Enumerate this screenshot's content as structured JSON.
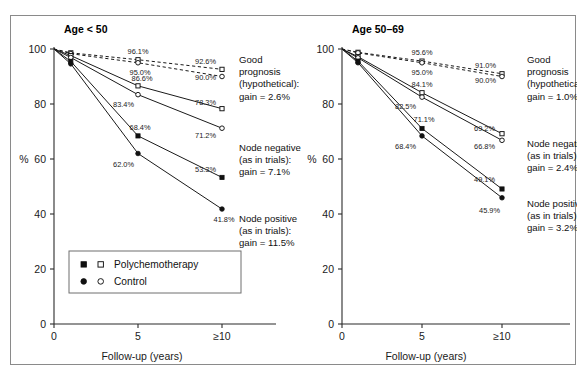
{
  "figure": {
    "y_axis_label": "%",
    "x_axis_label": "Follow-up (years)",
    "y_ticks": [
      "0",
      "20",
      "40",
      "60",
      "80",
      "100"
    ],
    "x_ticks": [
      "0",
      "5",
      "≥10"
    ]
  },
  "legend": {
    "rows": [
      {
        "label": "Polychemotherapy",
        "filled_marker": "square",
        "open_marker": "square"
      },
      {
        "label": "Control",
        "filled_marker": "circle",
        "open_marker": "circle"
      }
    ]
  },
  "chart_data": [
    {
      "type": "line",
      "title": "Age < 50",
      "xlabel": "Follow-up (years)",
      "ylabel": "%",
      "xlim": [
        0,
        11.5
      ],
      "ylim": [
        0,
        100
      ],
      "x": [
        0,
        1,
        5,
        10
      ],
      "x_tick_values": [
        0,
        5,
        10
      ],
      "x_tick_labels": [
        "0",
        "5",
        "≥10"
      ],
      "y_tick_values": [
        0,
        20,
        40,
        60,
        80,
        100
      ],
      "grid": false,
      "legend_position": "lower-left",
      "series": [
        {
          "name": "Good prognosis (hypothetical): Polychemotherapy",
          "group": "Good prognosis (hypothetical)",
          "arm": "Polychemotherapy",
          "marker": "square-open",
          "style": "dashed",
          "values": [
            100.0,
            98.6,
            96.1,
            92.6
          ],
          "point_labels": [
            "",
            "",
            "96.1%",
            "92.6%"
          ]
        },
        {
          "name": "Good prognosis (hypothetical): Control",
          "group": "Good prognosis (hypothetical)",
          "arm": "Control",
          "marker": "circle-open",
          "style": "dashed",
          "values": [
            100.0,
            98.3,
            95.0,
            90.0
          ],
          "point_labels": [
            "",
            "",
            "95.0%",
            "90.0%"
          ]
        },
        {
          "name": "Node negative (as in trials): Polychemotherapy",
          "group": "Node negative (as in trials)",
          "arm": "Polychemotherapy",
          "marker": "square-open",
          "style": "solid",
          "values": [
            100.0,
            97.6,
            86.6,
            78.3
          ],
          "point_labels": [
            "",
            "",
            "86.6%",
            "78.3%"
          ]
        },
        {
          "name": "Node negative (as in trials): Control",
          "group": "Node negative (as in trials)",
          "arm": "Control",
          "marker": "circle-open",
          "style": "solid",
          "values": [
            100.0,
            96.9,
            83.4,
            71.2
          ],
          "point_labels": [
            "",
            "",
            "83.4%",
            "71.2%"
          ]
        },
        {
          "name": "Node positive (as in trials): Polychemotherapy",
          "group": "Node positive (as in trials)",
          "arm": "Polychemotherapy",
          "marker": "square-filled",
          "style": "solid",
          "values": [
            100.0,
            95.5,
            68.4,
            53.3
          ],
          "point_labels": [
            "",
            "",
            "68.4%",
            "53.3%"
          ]
        },
        {
          "name": "Node positive (as in trials): Control",
          "group": "Node positive (as in trials)",
          "arm": "Control",
          "marker": "circle-filled",
          "style": "solid",
          "values": [
            100.0,
            94.6,
            62.0,
            41.8
          ],
          "point_labels": [
            "",
            "",
            "62.0%",
            "41.8%"
          ]
        }
      ],
      "annotations": [
        {
          "id": "good-prognosis",
          "lines": [
            "Good",
            "prognosis",
            "(hypothetical):",
            "gain = 2.6%"
          ],
          "gain": "2.6%"
        },
        {
          "id": "node-negative",
          "lines": [
            "Node negative",
            "(as in trials):",
            "gain = 7.1%"
          ],
          "gain": "7.1%"
        },
        {
          "id": "node-positive",
          "lines": [
            "Node positive",
            "(as in trials):",
            "gain = 11.5%"
          ],
          "gain": "11.5%"
        }
      ]
    },
    {
      "type": "line",
      "title": "Age 50–69",
      "xlabel": "Follow-up (years)",
      "ylabel": "%",
      "xlim": [
        0,
        11.5
      ],
      "ylim": [
        0,
        100
      ],
      "x": [
        0,
        1,
        5,
        10
      ],
      "x_tick_values": [
        0,
        5,
        10
      ],
      "x_tick_labels": [
        "0",
        "5",
        "≥10"
      ],
      "y_tick_values": [
        0,
        20,
        40,
        60,
        80,
        100
      ],
      "grid": false,
      "legend_position": "none",
      "series": [
        {
          "name": "Good prognosis (hypothetical): Polychemotherapy",
          "group": "Good prognosis (hypothetical)",
          "arm": "Polychemotherapy",
          "marker": "square-open",
          "style": "dashed",
          "values": [
            100.0,
            98.8,
            95.6,
            91.0
          ],
          "point_labels": [
            "",
            "",
            "95.6%",
            "91.0%"
          ]
        },
        {
          "name": "Good prognosis (hypothetical): Control",
          "group": "Good prognosis (hypothetical)",
          "arm": "Control",
          "marker": "circle-open",
          "style": "dashed",
          "values": [
            100.0,
            98.6,
            95.0,
            90.0
          ],
          "point_labels": [
            "",
            "",
            "95.0%",
            "90.0%"
          ]
        },
        {
          "name": "Node negative (as in trials): Polychemotherapy",
          "group": "Node negative (as in trials)",
          "arm": "Polychemotherapy",
          "marker": "square-open",
          "style": "solid",
          "values": [
            100.0,
            97.2,
            84.1,
            69.2
          ],
          "point_labels": [
            "",
            "",
            "84.1%",
            "69.2%"
          ]
        },
        {
          "name": "Node negative (as in trials): Control",
          "group": "Node negative (as in trials)",
          "arm": "Control",
          "marker": "circle-open",
          "style": "solid",
          "values": [
            100.0,
            96.8,
            82.5,
            66.8
          ],
          "point_labels": [
            "",
            "",
            "82.5%",
            "66.8%"
          ]
        },
        {
          "name": "Node positive (as in trials): Polychemotherapy",
          "group": "Node positive (as in trials)",
          "arm": "Polychemotherapy",
          "marker": "square-filled",
          "style": "solid",
          "values": [
            100.0,
            95.6,
            71.1,
            49.1
          ],
          "point_labels": [
            "",
            "",
            "71.1%",
            "49.1%"
          ]
        },
        {
          "name": "Node positive (as in trials): Control",
          "group": "Node positive (as in trials)",
          "arm": "Control",
          "marker": "circle-filled",
          "style": "solid",
          "values": [
            100.0,
            95.0,
            68.4,
            45.9
          ],
          "point_labels": [
            "",
            "",
            "68.4%",
            "45.9%"
          ]
        }
      ],
      "annotations": [
        {
          "id": "good-prognosis",
          "lines": [
            "Good",
            "prognosis",
            "(hypothetical):",
            "gain = 1.0%"
          ],
          "gain": "1.0%"
        },
        {
          "id": "node-negative",
          "lines": [
            "Node negative",
            "(as in trials):",
            "gain = 2.4%"
          ],
          "gain": "2.4%"
        },
        {
          "id": "node-positive",
          "lines": [
            "Node positive",
            "(as in trials):",
            "gain = 3.2%"
          ],
          "gain": "3.2%"
        }
      ]
    }
  ]
}
